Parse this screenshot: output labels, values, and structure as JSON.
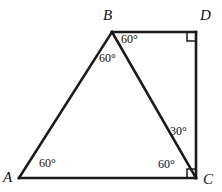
{
  "figure": {
    "type": "geometry-diagram",
    "background_color": "#ffffff",
    "line_color": "#1a1a1a",
    "width": 222,
    "height": 192
  },
  "vertices": [
    {
      "id": "A",
      "label": "A",
      "x": 19,
      "y": 178,
      "label_x": 3,
      "label_y": 170
    },
    {
      "id": "B",
      "label": "B",
      "x": 112,
      "y": 32,
      "label_x": 103,
      "label_y": 8
    },
    {
      "id": "C",
      "label": "C",
      "x": 196,
      "y": 178,
      "label_x": 203,
      "label_y": 172
    },
    {
      "id": "D",
      "label": "D",
      "x": 196,
      "y": 32,
      "label_x": 200,
      "label_y": 8
    }
  ],
  "edges": [
    {
      "id": "AB",
      "from": "A",
      "to": "B"
    },
    {
      "id": "BD",
      "from": "B",
      "to": "D"
    },
    {
      "id": "DC",
      "from": "D",
      "to": "C"
    },
    {
      "id": "CA",
      "from": "C",
      "to": "A"
    },
    {
      "id": "BC",
      "from": "B",
      "to": "C"
    }
  ],
  "angles": [
    {
      "id": "angle-A",
      "vertex": "A",
      "value": "60°",
      "x": 39,
      "y": 157
    },
    {
      "id": "angle-ABC",
      "vertex": "B",
      "value": "60°",
      "x": 99,
      "y": 52
    },
    {
      "id": "angle-DBC",
      "vertex": "B",
      "value": "60°",
      "x": 121,
      "y": 33
    },
    {
      "id": "angle-BCD",
      "vertex": "C",
      "value": "30°",
      "x": 170,
      "y": 125
    },
    {
      "id": "angle-BCA",
      "vertex": "C",
      "value": "60°",
      "x": 158,
      "y": 158
    }
  ],
  "right_angles": [
    {
      "id": "right-angle-D",
      "vertex": "D",
      "size": 9
    },
    {
      "id": "right-angle-C",
      "vertex": "C",
      "size": 9
    }
  ]
}
